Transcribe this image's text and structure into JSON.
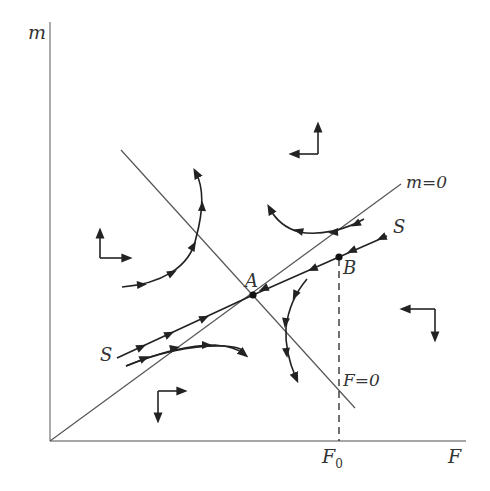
{
  "figure": {
    "type": "phase-diagram",
    "axes": {
      "y_label": "m",
      "x_label": "F",
      "x_tick_label": "F",
      "x_tick_subscript": "0"
    },
    "nullclines": [
      {
        "id": "m-nullcline",
        "label": "m=0"
      },
      {
        "id": "F-nullcline",
        "label": "F=0"
      }
    ],
    "points": [
      {
        "id": "A",
        "label": "A"
      },
      {
        "id": "B",
        "label": "B"
      }
    ],
    "manifold": {
      "label_left": "S",
      "label_right": "S"
    },
    "direction_indicators": [
      {
        "region": "upper-left",
        "directions": [
          "up",
          "right"
        ]
      },
      {
        "region": "upper-right",
        "directions": [
          "up",
          "left"
        ]
      },
      {
        "region": "lower-right",
        "directions": [
          "left",
          "down"
        ]
      },
      {
        "region": "lower-left",
        "directions": [
          "right",
          "down"
        ]
      }
    ]
  }
}
